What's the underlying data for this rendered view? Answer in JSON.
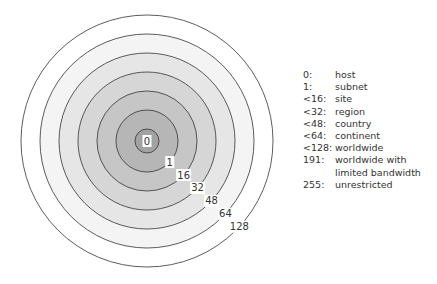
{
  "rings": [
    {
      "value": "128",
      "radius": 126,
      "fill": "#ffffff"
    },
    {
      "value": "64",
      "radius": 107,
      "fill": "#f4f4f4"
    },
    {
      "value": "48",
      "radius": 88,
      "fill": "#e6e6e6"
    },
    {
      "value": "32",
      "radius": 69,
      "fill": "#d6d6d6"
    },
    {
      "value": "16",
      "radius": 50,
      "fill": "#c6c6c6"
    },
    {
      "value": "1",
      "radius": 31,
      "fill": "#b6b6b6"
    },
    {
      "value": "0",
      "radius": 12,
      "fill": "#a2a2a2"
    }
  ],
  "legend": [
    {
      "key": "0:",
      "label": "host"
    },
    {
      "key": "1:",
      "label": "subnet"
    },
    {
      "key": "<16:",
      "label": "site"
    },
    {
      "key": "<32:",
      "label": "region"
    },
    {
      "key": "<48:",
      "label": "country"
    },
    {
      "key": "<64:",
      "label": "continent"
    },
    {
      "key": "<128:",
      "label": "worldwide"
    },
    {
      "key": "191:",
      "label": "worldwide with limited bandwidth"
    },
    {
      "key": "255:",
      "label": "unrestricted"
    }
  ]
}
